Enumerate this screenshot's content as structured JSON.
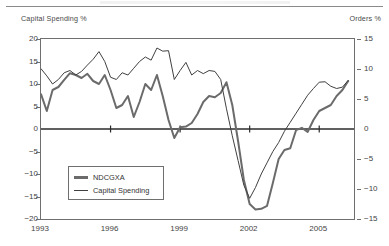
{
  "chart_data": {
    "type": "line",
    "title": "",
    "xlabel": "",
    "ylabel": "Capital Spending %",
    "y2label": "Orders %",
    "grid": false,
    "legend_position": "lower-left",
    "xlim": [
      1993.0,
      2006.5
    ],
    "ylim": [
      -20,
      20
    ],
    "y2lim": [
      -15,
      15
    ],
    "yticks": [
      20,
      15,
      10,
      5,
      0,
      -5,
      -10,
      -15,
      -20
    ],
    "ytick_labels": [
      "20",
      "15",
      "10",
      "5",
      "0",
      "−5",
      "−10",
      "−15",
      "−20"
    ],
    "y2ticks": [
      15,
      10,
      5,
      0,
      -5,
      -10,
      -15
    ],
    "y2tick_labels": [
      "15",
      "10",
      "5",
      "0",
      "−5",
      "−10",
      "−15"
    ],
    "xticks": [
      1993,
      1996,
      1999,
      2002,
      2005
    ],
    "xtick_labels": [
      "1993",
      "1996",
      "1999",
      "2002",
      "2005"
    ],
    "zero_line": 0,
    "series": [
      {
        "name": "NDCGXA",
        "axis": "right",
        "style": "thick",
        "color": "#6b6b6b",
        "x": [
          1993.0,
          1993.25,
          1993.5,
          1993.75,
          1994.0,
          1994.25,
          1994.5,
          1994.75,
          1995.0,
          1995.25,
          1995.5,
          1995.75,
          1996.0,
          1996.25,
          1996.5,
          1996.75,
          1997.0,
          1997.25,
          1997.5,
          1997.75,
          1998.0,
          1998.25,
          1998.5,
          1998.75,
          1999.0,
          1999.25,
          1999.5,
          1999.75,
          2000.0,
          2000.25,
          2000.5,
          2000.75,
          2001.0,
          2001.25,
          2001.5,
          2001.75,
          2002.0,
          2002.25,
          2002.5,
          2002.75,
          2003.0,
          2003.25,
          2003.5,
          2003.75,
          2004.0,
          2004.25,
          2004.5,
          2004.75,
          2005.0,
          2005.25,
          2005.5,
          2005.75,
          2006.0,
          2006.25
        ],
        "values": [
          5.8,
          3.0,
          6.5,
          7.0,
          8.2,
          9.3,
          9.0,
          8.5,
          9.2,
          8.0,
          7.5,
          9.0,
          6.5,
          3.5,
          4.0,
          5.5,
          2.0,
          4.5,
          7.5,
          6.5,
          9.0,
          5.5,
          1.5,
          -1.5,
          0.3,
          0.4,
          1.0,
          2.5,
          4.5,
          5.5,
          5.3,
          6.0,
          7.8,
          4.0,
          -2.0,
          -8.5,
          -12.5,
          -13.4,
          -13.3,
          -12.8,
          -9.0,
          -5.0,
          -3.5,
          -3.2,
          -0.2,
          0.2,
          -0.5,
          1.5,
          3.0,
          3.5,
          4.0,
          5.5,
          6.5,
          8.0
        ]
      },
      {
        "name": "Capital Spending",
        "axis": "left",
        "style": "thin",
        "color": "#404040",
        "x": [
          1993.0,
          1993.25,
          1993.5,
          1993.75,
          1994.0,
          1994.25,
          1994.5,
          1994.75,
          1995.0,
          1995.25,
          1995.5,
          1995.75,
          1996.0,
          1996.25,
          1996.5,
          1996.75,
          1997.0,
          1997.25,
          1997.5,
          1997.75,
          1998.0,
          1998.25,
          1998.5,
          1998.75,
          1999.0,
          1999.25,
          1999.5,
          1999.75,
          2000.0,
          2000.25,
          2000.5,
          2000.75,
          2001.0,
          2001.25,
          2001.5,
          2001.75,
          2002.0,
          2002.25,
          2002.5,
          2002.75,
          2003.0,
          2003.25,
          2003.5,
          2003.75,
          2004.0,
          2004.25,
          2004.5,
          2004.75,
          2005.0,
          2005.25,
          2005.5,
          2005.75,
          2006.0,
          2006.25
        ],
        "values": [
          13.4,
          11.8,
          10.0,
          11.0,
          12.5,
          13.0,
          12.0,
          12.8,
          14.2,
          15.5,
          17.2,
          15.0,
          11.5,
          11.0,
          12.5,
          12.0,
          13.5,
          15.0,
          16.0,
          15.3,
          18.0,
          17.3,
          17.4,
          11.0,
          13.0,
          14.8,
          12.0,
          13.0,
          12.3,
          13.0,
          12.8,
          11.0,
          4.5,
          -1.5,
          -7.0,
          -12.5,
          -15.4,
          -13.0,
          -10.0,
          -7.5,
          -5.0,
          -3.0,
          -0.5,
          1.5,
          3.5,
          5.5,
          7.5,
          9.0,
          10.4,
          10.5,
          9.5,
          9.0,
          9.3,
          10.8
        ]
      }
    ]
  },
  "axis_titles": {
    "left": "Capital Spending %",
    "right": "Orders %"
  },
  "legend": {
    "items": [
      {
        "label": "NDCGXA",
        "style": "thick"
      },
      {
        "label": "Capital Spending",
        "style": "thin"
      }
    ]
  }
}
